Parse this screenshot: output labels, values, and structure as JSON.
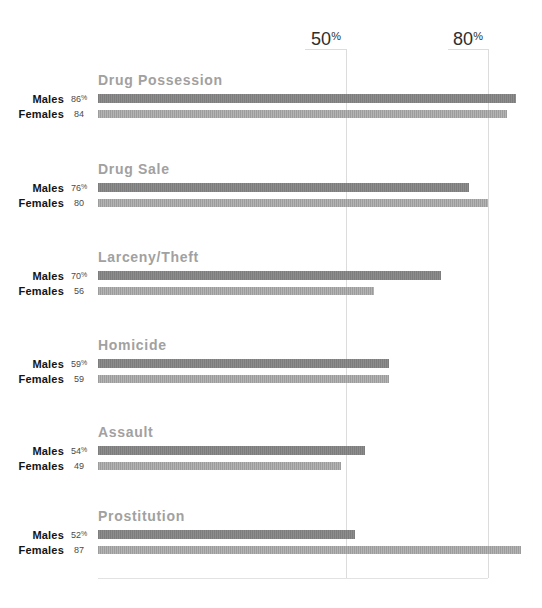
{
  "chart_data": {
    "type": "bar",
    "orientation": "horizontal",
    "categories": [
      "Drug Possession",
      "Drug Sale",
      "Larceny/Theft",
      "Homicide",
      "Assault",
      "Prostitution"
    ],
    "series": [
      {
        "name": "Males",
        "values": [
          86,
          76,
          70,
          59,
          54,
          52
        ]
      },
      {
        "name": "Females",
        "values": [
          84,
          80,
          56,
          59,
          49,
          87
        ]
      }
    ],
    "xlim": [
      0,
      100
    ],
    "x_ticks": [
      50,
      80
    ],
    "tick_position": "top",
    "grid": "vertical lines at ticks, light gray",
    "value_label_position": "left of each bar"
  },
  "axis": {
    "ticks": [
      {
        "label": "50",
        "suffix": "%"
      },
      {
        "label": "80",
        "suffix": "%"
      }
    ]
  },
  "groups": [
    {
      "heading": "Drug Possession",
      "bars": [
        {
          "label": "Males",
          "value": 86,
          "suffix": "%"
        },
        {
          "label": "Females",
          "value": 84,
          "suffix": ""
        }
      ]
    },
    {
      "heading": "Drug Sale",
      "bars": [
        {
          "label": "Males",
          "value": 76,
          "suffix": "%"
        },
        {
          "label": "Females",
          "value": 80,
          "suffix": ""
        }
      ]
    },
    {
      "heading": "Larceny/Theft",
      "bars": [
        {
          "label": "Males",
          "value": 70,
          "suffix": "%"
        },
        {
          "label": "Females",
          "value": 56,
          "suffix": ""
        }
      ]
    },
    {
      "heading": "Homicide",
      "bars": [
        {
          "label": "Males",
          "value": 59,
          "suffix": "%"
        },
        {
          "label": "Females",
          "value": 59,
          "suffix": ""
        }
      ]
    },
    {
      "heading": "Assault",
      "bars": [
        {
          "label": "Males",
          "value": 54,
          "suffix": "%"
        },
        {
          "label": "Females",
          "value": 49,
          "suffix": ""
        }
      ]
    },
    {
      "heading": "Prostitution",
      "bars": [
        {
          "label": "Males",
          "value": 52,
          "suffix": "%"
        },
        {
          "label": "Females",
          "value": 87,
          "suffix": ""
        }
      ]
    }
  ],
  "colors": {
    "males_bar": "#828282",
    "females_bar": "#a7a7a7",
    "heading": "#a1a1a1",
    "grid_line": "#dcdcdc",
    "baseline": "#e2e2e2",
    "label_text": "#141414",
    "value_text": "#4a4a4a",
    "tick_text": "#2e2e2e"
  }
}
